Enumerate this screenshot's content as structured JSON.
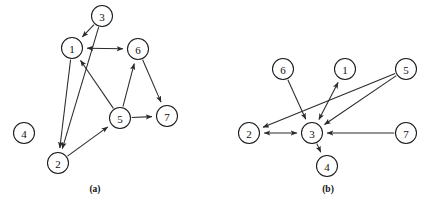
{
  "figure": {
    "background_color": "#ffffff",
    "stroke_color": "#2a2a2a",
    "node_fill": "#ffffff",
    "node_radius": 10.5,
    "arrow_size": 5.5
  },
  "panels": [
    {
      "id": "a",
      "caption": "(a)",
      "caption_pos": {
        "x": 95,
        "y": 192
      },
      "nodes": [
        {
          "id": "1",
          "label": "1",
          "x": 72,
          "y": 48
        },
        {
          "id": "2",
          "label": "2",
          "x": 58,
          "y": 163
        },
        {
          "id": "3",
          "label": "3",
          "x": 102,
          "y": 16
        },
        {
          "id": "4",
          "label": "4",
          "x": 24,
          "y": 133
        },
        {
          "id": "5",
          "label": "5",
          "x": 120,
          "y": 118
        },
        {
          "id": "6",
          "label": "6",
          "x": 138,
          "y": 49
        },
        {
          "id": "7",
          "label": "7",
          "x": 167,
          "y": 116
        }
      ],
      "edges": [
        {
          "from": "3",
          "to": "1",
          "arrows": "forward"
        },
        {
          "from": "3",
          "to": "2",
          "arrows": "forward"
        },
        {
          "from": "1",
          "to": "6",
          "arrows": "both"
        },
        {
          "from": "1",
          "to": "2",
          "arrows": "forward"
        },
        {
          "from": "5",
          "to": "1",
          "arrows": "forward"
        },
        {
          "from": "2",
          "to": "5",
          "arrows": "forward"
        },
        {
          "from": "5",
          "to": "6",
          "arrows": "forward"
        },
        {
          "from": "5",
          "to": "7",
          "arrows": "forward"
        },
        {
          "from": "6",
          "to": "7",
          "arrows": "forward"
        }
      ]
    },
    {
      "id": "b",
      "caption": "(b)",
      "caption_pos": {
        "x": 328,
        "y": 192
      },
      "nodes": [
        {
          "id": "1",
          "label": "1",
          "x": 345,
          "y": 69
        },
        {
          "id": "2",
          "label": "2",
          "x": 249,
          "y": 133
        },
        {
          "id": "3",
          "label": "3",
          "x": 312,
          "y": 133
        },
        {
          "id": "4",
          "label": "4",
          "x": 327,
          "y": 166
        },
        {
          "id": "5",
          "label": "5",
          "x": 406,
          "y": 69
        },
        {
          "id": "6",
          "label": "6",
          "x": 283,
          "y": 69
        },
        {
          "id": "7",
          "label": "7",
          "x": 406,
          "y": 133
        }
      ],
      "edges": [
        {
          "from": "6",
          "to": "3",
          "arrows": "forward"
        },
        {
          "from": "5",
          "to": "2",
          "arrows": "forward"
        },
        {
          "from": "5",
          "to": "3",
          "arrows": "forward"
        },
        {
          "from": "1",
          "to": "3",
          "arrows": "both"
        },
        {
          "from": "2",
          "to": "3",
          "arrows": "both"
        },
        {
          "from": "7",
          "to": "3",
          "arrows": "forward"
        },
        {
          "from": "3",
          "to": "4",
          "arrows": "forward"
        }
      ]
    }
  ]
}
